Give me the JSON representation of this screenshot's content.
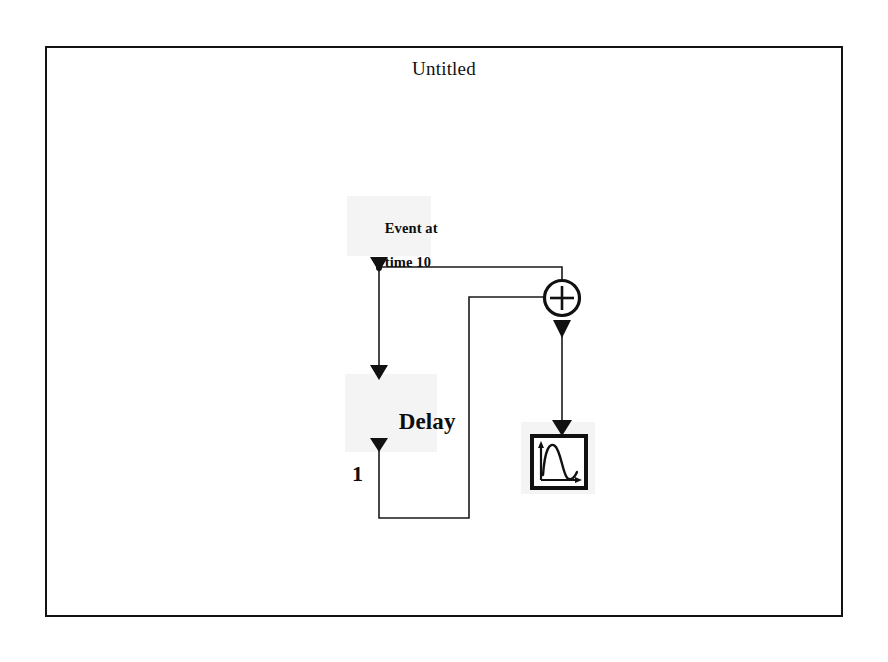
{
  "window": {
    "title": "Untitled",
    "border_color": "#131313",
    "background": "#ffffff"
  },
  "diagram": {
    "line_color": "#1a1a1a",
    "blocks": [
      {
        "id": "event-source",
        "name": "event-source-block",
        "label_line1": "Event at",
        "label_line2": "time 10",
        "kind": "event-source"
      },
      {
        "id": "delay",
        "name": "delay-block",
        "label_line1": "Delay",
        "label_line2": "1",
        "kind": "delay"
      },
      {
        "id": "sum",
        "name": "sum-block",
        "label_line1": "+",
        "kind": "sum"
      },
      {
        "id": "scope",
        "name": "scope-block",
        "label_line1": "",
        "kind": "scope"
      }
    ],
    "signals": [
      {
        "name": "event-to-delay",
        "from": "event-source",
        "to": "delay"
      },
      {
        "name": "event-to-sum",
        "from": "event-source",
        "to": "sum"
      },
      {
        "name": "delay-to-sum",
        "from": "delay",
        "to": "sum"
      },
      {
        "name": "sum-to-scope",
        "from": "sum",
        "to": "scope"
      }
    ]
  },
  "icons": {
    "sum": "plus-icon",
    "scope": "scope-waveform-icon",
    "arrow": "arrowhead-down-icon"
  }
}
